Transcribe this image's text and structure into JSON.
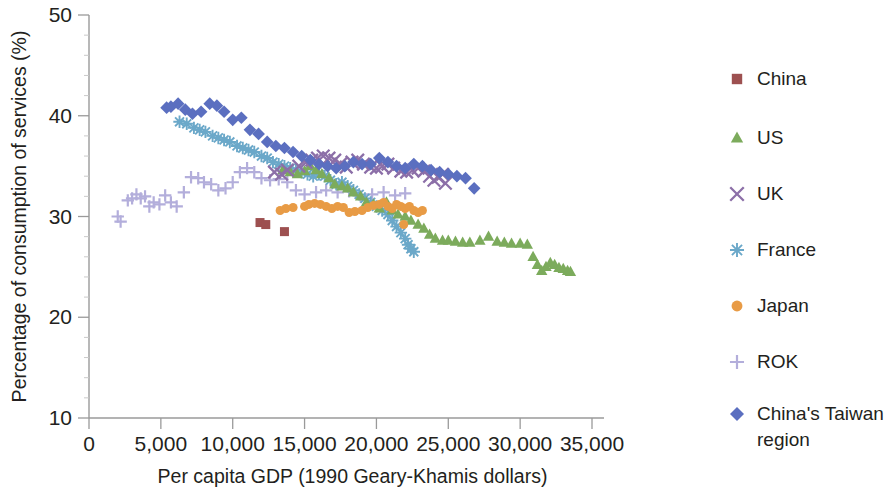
{
  "chart_data": {
    "type": "scatter",
    "title": "",
    "xlabel": "Per capita GDP (1990 Geary-Khamis dollars)",
    "ylabel": "Percentage of consumption of services (%)",
    "xlim": [
      0,
      35000
    ],
    "ylim": [
      10,
      50
    ],
    "xticks": [
      0,
      5000,
      10000,
      15000,
      20000,
      25000,
      30000,
      35000
    ],
    "xtick_labels": [
      "0",
      "5,000",
      "10,000",
      "15,000",
      "20,000",
      "25,000",
      "30,000",
      "35,000"
    ],
    "yticks": [
      10,
      20,
      30,
      40,
      50
    ],
    "ytick_labels": [
      "10",
      "20",
      "30",
      "40",
      "50"
    ],
    "grid": false,
    "legend_position": "right",
    "series": [
      {
        "name": "China",
        "marker": "square",
        "color": "#9d5050",
        "points": [
          [
            11900,
            29.4
          ],
          [
            12300,
            29.2
          ],
          [
            13600,
            28.5
          ]
        ]
      },
      {
        "name": "US",
        "marker": "triangle",
        "color": "#7cab5c",
        "points": [
          [
            13500,
            34.6
          ],
          [
            14000,
            34.4
          ],
          [
            14500,
            34.2
          ],
          [
            15000,
            34.5
          ],
          [
            15400,
            35.0
          ],
          [
            15800,
            34.6
          ],
          [
            16200,
            34.2
          ],
          [
            16700,
            33.8
          ],
          [
            17100,
            33.2
          ],
          [
            17600,
            33.0
          ],
          [
            18000,
            32.8
          ],
          [
            18400,
            32.4
          ],
          [
            18900,
            32.0
          ],
          [
            19300,
            31.4
          ],
          [
            19800,
            31.2
          ],
          [
            20200,
            30.8
          ],
          [
            20700,
            31.4
          ],
          [
            21100,
            30.6
          ],
          [
            21500,
            30.2
          ],
          [
            22000,
            30.0
          ],
          [
            22400,
            29.6
          ],
          [
            22900,
            29.2
          ],
          [
            23300,
            28.8
          ],
          [
            23700,
            28.2
          ],
          [
            24100,
            27.8
          ],
          [
            24600,
            27.6
          ],
          [
            25000,
            27.6
          ],
          [
            25500,
            27.5
          ],
          [
            26000,
            27.4
          ],
          [
            26500,
            27.4
          ],
          [
            27200,
            27.6
          ],
          [
            27800,
            28.0
          ],
          [
            28400,
            27.5
          ],
          [
            28900,
            27.4
          ],
          [
            29400,
            27.3
          ],
          [
            30000,
            27.3
          ],
          [
            30500,
            27.2
          ],
          [
            30900,
            26.0
          ],
          [
            31200,
            25.2
          ],
          [
            31500,
            24.6
          ],
          [
            31800,
            25.0
          ],
          [
            32100,
            25.4
          ],
          [
            32400,
            25.2
          ],
          [
            32700,
            24.9
          ],
          [
            33000,
            24.8
          ],
          [
            33300,
            24.6
          ],
          [
            33500,
            24.5
          ]
        ]
      },
      {
        "name": "UK",
        "marker": "x",
        "color": "#8c6fa8",
        "points": [
          [
            14600,
            35.0
          ],
          [
            15100,
            35.4
          ],
          [
            15500,
            35.6
          ],
          [
            15900,
            35.8
          ],
          [
            16300,
            36.0
          ],
          [
            16700,
            35.8
          ],
          [
            17100,
            35.6
          ],
          [
            17500,
            35.2
          ],
          [
            17900,
            34.9
          ],
          [
            18300,
            35.4
          ],
          [
            18700,
            35.6
          ],
          [
            19100,
            35.2
          ],
          [
            19600,
            34.9
          ],
          [
            20000,
            34.8
          ],
          [
            20400,
            35.0
          ],
          [
            20800,
            35.2
          ],
          [
            21200,
            34.8
          ],
          [
            21700,
            34.5
          ],
          [
            22100,
            34.4
          ],
          [
            22500,
            34.6
          ],
          [
            22900,
            34.8
          ],
          [
            23300,
            34.5
          ],
          [
            23700,
            34.0
          ],
          [
            24000,
            33.6
          ],
          [
            24300,
            33.9
          ],
          [
            24600,
            34.2
          ],
          [
            24800,
            33.3
          ],
          [
            13800,
            34.6
          ],
          [
            13400,
            34.2
          ],
          [
            12900,
            34.4
          ]
        ]
      },
      {
        "name": "France",
        "marker": "asterisk",
        "color": "#6ba8c9",
        "points": [
          [
            6300,
            39.4
          ],
          [
            6800,
            39.2
          ],
          [
            7300,
            38.8
          ],
          [
            7700,
            38.6
          ],
          [
            8100,
            38.4
          ],
          [
            8600,
            38.0
          ],
          [
            9000,
            37.8
          ],
          [
            9400,
            37.6
          ],
          [
            9800,
            37.4
          ],
          [
            10300,
            37.0
          ],
          [
            10700,
            36.8
          ],
          [
            11100,
            36.6
          ],
          [
            11500,
            36.4
          ],
          [
            12000,
            36.0
          ],
          [
            12400,
            35.8
          ],
          [
            12800,
            35.4
          ],
          [
            13200,
            35.2
          ],
          [
            13600,
            35.0
          ],
          [
            14000,
            34.8
          ],
          [
            14400,
            34.6
          ],
          [
            14800,
            34.4
          ],
          [
            15200,
            34.2
          ],
          [
            15600,
            34.0
          ],
          [
            16000,
            34.2
          ],
          [
            16400,
            34.0
          ],
          [
            16800,
            33.6
          ],
          [
            17200,
            33.2
          ],
          [
            17600,
            33.4
          ],
          [
            18000,
            33.0
          ],
          [
            18400,
            32.6
          ],
          [
            18800,
            32.2
          ],
          [
            19200,
            31.8
          ],
          [
            19600,
            31.4
          ],
          [
            20000,
            31.0
          ],
          [
            20400,
            30.6
          ],
          [
            20800,
            30.2
          ],
          [
            21100,
            29.6
          ],
          [
            21400,
            29.0
          ],
          [
            21700,
            28.4
          ],
          [
            22000,
            27.8
          ],
          [
            22200,
            27.2
          ],
          [
            22400,
            26.8
          ],
          [
            22600,
            26.5
          ]
        ]
      },
      {
        "name": "Japan",
        "marker": "circle",
        "color": "#e89b45"
      },
      {
        "name": "ROK",
        "marker": "plus",
        "color": "#b3aedb"
      },
      {
        "name": "China's Taiwan region",
        "marker": "diamond",
        "color": "#5b6fc0"
      }
    ],
    "japan_points": [
      [
        15000,
        31.0
      ],
      [
        15300,
        31.2
      ],
      [
        15700,
        31.3
      ],
      [
        16100,
        31.2
      ],
      [
        16500,
        31.0
      ],
      [
        16900,
        30.8
      ],
      [
        17300,
        31.0
      ],
      [
        17700,
        30.9
      ],
      [
        18100,
        30.4
      ],
      [
        18500,
        30.5
      ],
      [
        19000,
        30.6
      ],
      [
        19400,
        30.9
      ],
      [
        19800,
        31.1
      ],
      [
        20200,
        31.2
      ],
      [
        20500,
        31.4
      ],
      [
        20800,
        31.0
      ],
      [
        21100,
        30.8
      ],
      [
        21400,
        31.2
      ],
      [
        21700,
        31.0
      ],
      [
        22000,
        30.8
      ],
      [
        22300,
        31.0
      ],
      [
        22600,
        30.6
      ],
      [
        22900,
        30.4
      ],
      [
        23200,
        30.6
      ],
      [
        21900,
        29.2
      ],
      [
        14200,
        30.9
      ],
      [
        13700,
        30.8
      ],
      [
        13300,
        30.6
      ]
    ],
    "rok_points": [
      [
        2000,
        30.0
      ],
      [
        2200,
        29.5
      ],
      [
        2700,
        31.6
      ],
      [
        3000,
        31.8
      ],
      [
        3300,
        32.2
      ],
      [
        3600,
        31.8
      ],
      [
        3900,
        32.0
      ],
      [
        4200,
        31.0
      ],
      [
        4500,
        31.4
      ],
      [
        4900,
        31.2
      ],
      [
        5300,
        32.1
      ],
      [
        5700,
        31.4
      ],
      [
        6100,
        31.0
      ],
      [
        6600,
        32.4
      ],
      [
        7100,
        33.9
      ],
      [
        7600,
        33.8
      ],
      [
        8000,
        33.4
      ],
      [
        8500,
        33.2
      ],
      [
        9000,
        32.6
      ],
      [
        9500,
        32.8
      ],
      [
        10000,
        33.4
      ],
      [
        10500,
        34.4
      ],
      [
        11000,
        34.8
      ],
      [
        11500,
        34.4
      ],
      [
        12000,
        33.8
      ],
      [
        12600,
        33.6
      ],
      [
        13200,
        33.7
      ],
      [
        13800,
        33.4
      ],
      [
        14400,
        32.6
      ],
      [
        15000,
        32.2
      ],
      [
        15800,
        32.4
      ],
      [
        16500,
        32.6
      ],
      [
        17300,
        32.4
      ],
      [
        18100,
        32.5
      ],
      [
        18900,
        32.0
      ],
      [
        19700,
        32.2
      ],
      [
        20500,
        32.4
      ],
      [
        21300,
        32.1
      ],
      [
        22000,
        32.3
      ]
    ],
    "taiwan_points": [
      [
        5400,
        40.8
      ],
      [
        5700,
        40.9
      ],
      [
        6200,
        41.2
      ],
      [
        6700,
        40.6
      ],
      [
        7200,
        40.2
      ],
      [
        7800,
        40.4
      ],
      [
        8400,
        41.2
      ],
      [
        8900,
        41.0
      ],
      [
        9400,
        40.4
      ],
      [
        10000,
        39.6
      ],
      [
        10600,
        39.8
      ],
      [
        11200,
        38.6
      ],
      [
        11800,
        38.2
      ],
      [
        12400,
        37.4
      ],
      [
        13000,
        37.0
      ],
      [
        13600,
        36.8
      ],
      [
        14200,
        36.4
      ],
      [
        14800,
        36.0
      ],
      [
        15400,
        35.6
      ],
      [
        16000,
        35.2
      ],
      [
        16600,
        35.0
      ],
      [
        17200,
        34.8
      ],
      [
        17800,
        35.0
      ],
      [
        18400,
        35.4
      ],
      [
        19000,
        35.2
      ],
      [
        19600,
        35.2
      ],
      [
        20200,
        35.8
      ],
      [
        20800,
        35.4
      ],
      [
        21400,
        35.0
      ],
      [
        22000,
        34.8
      ],
      [
        22600,
        35.2
      ],
      [
        23200,
        35.0
      ],
      [
        23800,
        34.6
      ],
      [
        24400,
        34.4
      ],
      [
        25000,
        34.2
      ],
      [
        25600,
        34.0
      ],
      [
        26200,
        33.8
      ],
      [
        26800,
        32.8
      ]
    ]
  },
  "legend": {
    "entries": [
      {
        "label": "China",
        "marker": "square",
        "color": "#9d5050"
      },
      {
        "label": "US",
        "marker": "triangle",
        "color": "#7cab5c"
      },
      {
        "label": "UK",
        "marker": "x",
        "color": "#8c6fa8"
      },
      {
        "label": "France",
        "marker": "asterisk",
        "color": "#6ba8c9"
      },
      {
        "label": "Japan",
        "marker": "circle",
        "color": "#e89b45"
      },
      {
        "label": "ROK",
        "marker": "plus",
        "color": "#b3aedb"
      },
      {
        "label": "China's Taiwan region",
        "marker": "diamond",
        "color": "#5b6fc0",
        "line2": "region",
        "line1": "China's Taiwan"
      }
    ]
  }
}
